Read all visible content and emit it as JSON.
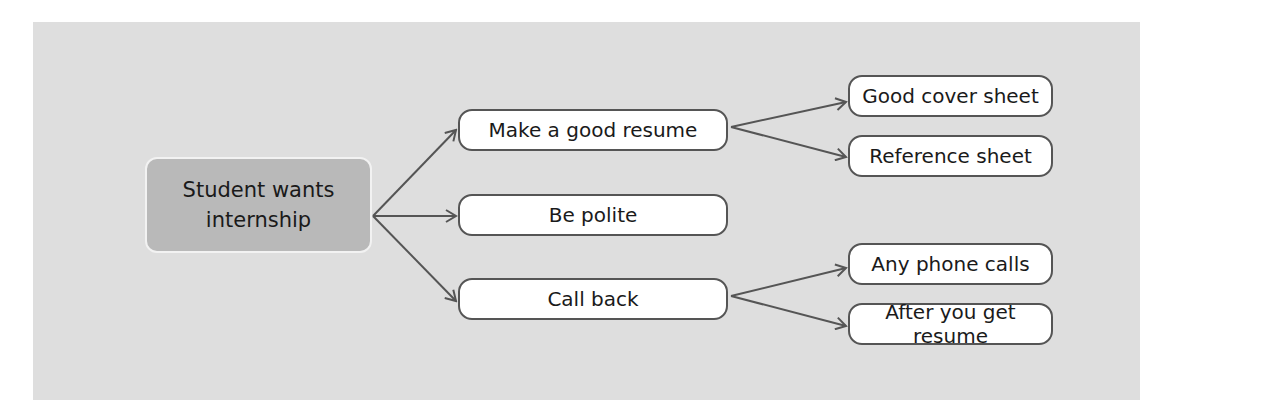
{
  "diagram": {
    "type": "tree",
    "direction": "left-to-right",
    "root": {
      "line1": "Student wants",
      "line2": "internship"
    },
    "level1": [
      {
        "label": "Make a good resume"
      },
      {
        "label": "Be polite"
      },
      {
        "label": "Call back"
      }
    ],
    "level2": [
      {
        "label": "Good cover sheet",
        "parent": "Make a good resume"
      },
      {
        "label": "Reference sheet",
        "parent": "Make a good resume"
      },
      {
        "label": "Any phone calls",
        "parent": "Call back"
      },
      {
        "label": "After you get resume",
        "parent": "Call back"
      }
    ],
    "colors": {
      "panel": "#dedede",
      "root_fill": "#b9b9b9",
      "node_fill": "#ffffff",
      "node_border": "#555555",
      "arrow": "#555555",
      "text": "#1a1a1a"
    }
  }
}
